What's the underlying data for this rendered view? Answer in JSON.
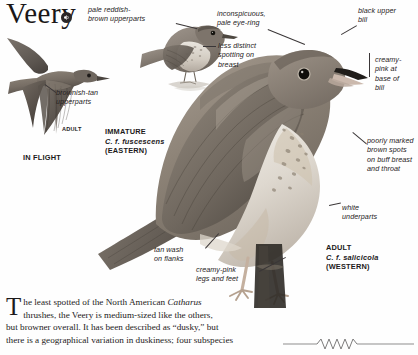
{
  "page": {
    "title": "Veery",
    "audio_icon": "speaker-icon"
  },
  "annotations": [
    {
      "id": "pale-reddish-brown-upperparts",
      "text": "pale reddish-\nbrown upperparts"
    },
    {
      "id": "brownish-tan-upperparts",
      "text": "brownish-tan\nupperparts"
    },
    {
      "id": "less-distinct-spotting",
      "text": "less distinct\nspotting on\nbreast"
    },
    {
      "id": "inconspicuous-pale-eye-ring",
      "text": "inconspicuous,\npale eye-ring"
    },
    {
      "id": "black-upper-bill",
      "text": "black upper\nbill"
    },
    {
      "id": "creamy-pink-base-of-bill",
      "text": "creamy-\npink at\nbase of\nbill"
    },
    {
      "id": "poorly-marked-brown-spots",
      "text": "poorly marked\nbrown spots\non buff breast\nand throat"
    },
    {
      "id": "white-underparts",
      "text": "white\nunderparts"
    },
    {
      "id": "tan-wash-on-flanks",
      "text": "tan wash\non flanks"
    },
    {
      "id": "creamy-pink-legs-and-feet",
      "text": "creamy-pink\nlegs and feet"
    }
  ],
  "plates": {
    "in_flight": "IN FLIGHT",
    "flight_adult": "ADULT",
    "immature": {
      "age": "IMMATURE",
      "subspecies": "C. f. fuscescens",
      "range": "(EASTERN)"
    },
    "adult": {
      "age": "ADULT",
      "subspecies": "C. f. salicicola",
      "range": "(WESTERN)"
    }
  },
  "caption": {
    "dropcap": "T",
    "line1_a": "he least spotted of the North American ",
    "genus": "Catharus",
    "line2": "thrushes, the Veery is medium-sized like the others,",
    "line3": "but browner overall. It has been described as “dusky,” but",
    "line4": "there is a geographical variation in duskiness; four subspecies"
  },
  "colors": {
    "ink": "#231f20",
    "plumage_dark": "#6e6660",
    "plumage_mid": "#978c82",
    "plumage_light": "#c3bab0",
    "belly": "#efece6",
    "rule": "#8e8d8d"
  }
}
